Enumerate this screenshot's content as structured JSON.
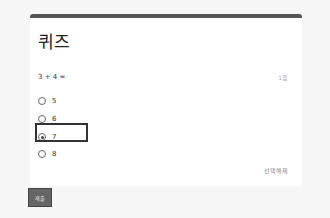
{
  "quiz": {
    "title": "퀴즈",
    "question": "3 + 4 =",
    "points": "1점",
    "options": [
      {
        "label": "5",
        "selected": false
      },
      {
        "label": "6",
        "selected": false
      },
      {
        "label": "7",
        "selected": true
      },
      {
        "label": "8",
        "selected": false
      }
    ],
    "clear_label": "선택해제"
  },
  "actions": {
    "submit_label": "제출"
  },
  "colors": {
    "accent_bar": "#555555",
    "highlight_border": "#333333",
    "submit_bg": "#666666"
  }
}
